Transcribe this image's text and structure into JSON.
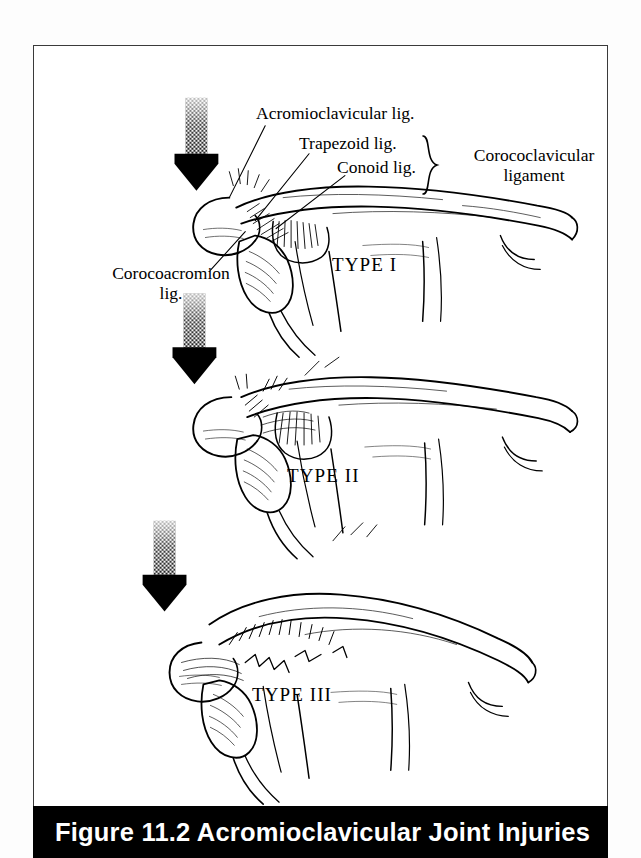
{
  "figure": {
    "caption": "Figure 11.2  Acromioclavicular Joint Injuries",
    "frame_color": "#3a3a3a",
    "caption_bar_color": "#000000",
    "caption_text_color": "#ffffff",
    "ink_color": "#000000",
    "page_background": "#ffffff"
  },
  "labels": {
    "acromioclavicular": "Acromioclavicular lig.",
    "trapezoid": "Trapezoid lig.",
    "conoid": "Conoid lig.",
    "coracoclavicular_line1": "Corococlavicular",
    "coracoclavicular_line2": "ligament",
    "coracoacromial_line1": "Corocoacromion",
    "coracoacromial_line2": "lig.",
    "brace_symbol": "}"
  },
  "panels": [
    {
      "name": "type-1",
      "type_label": "TYPE I",
      "arrow": "down-arrow-icon",
      "description": "Sprain of acromioclavicular ligament; clavicle aligned with acromion"
    },
    {
      "name": "type-2",
      "type_label": "TYPE II",
      "arrow": "down-arrow-icon",
      "description": "Acromioclavicular ligament torn, coracoclavicular ligament intact; partial separation"
    },
    {
      "name": "type-3",
      "type_label": "TYPE III",
      "arrow": "down-arrow-icon",
      "description": "Both acromioclavicular and coracoclavicular ligaments torn; complete dislocation"
    }
  ],
  "anatomy_parts": [
    "clavicle",
    "acromion",
    "coracoid-process",
    "scapula-spine",
    "humeral-head",
    "acromioclavicular-ligament",
    "trapezoid-ligament",
    "conoid-ligament",
    "coracoacromial-ligament"
  ]
}
